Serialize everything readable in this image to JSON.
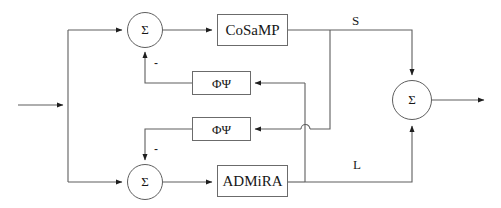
{
  "diagram": {
    "blocks": [
      {
        "id": "cosamp",
        "label": "CoSaMP"
      },
      {
        "id": "admira",
        "label": "ADMiRA"
      },
      {
        "id": "phi_psi_top",
        "label": "ΦΨ"
      },
      {
        "id": "phi_psi_bottom",
        "label": "ΦΨ"
      }
    ],
    "sum_nodes": [
      {
        "id": "sum-top",
        "label": "Σ",
        "sign": "−"
      },
      {
        "id": "sum-bottom",
        "label": "Σ",
        "sign": "−"
      },
      {
        "id": "sum-output",
        "label": "Σ",
        "sign": ""
      }
    ],
    "signal_labels": [
      {
        "id": "signal-s",
        "label": "S"
      },
      {
        "id": "signal-l",
        "label": "L"
      }
    ],
    "sign_marks": [
      {
        "id": "minus-top",
        "label": "-"
      },
      {
        "id": "minus-bottom",
        "label": "-"
      }
    ],
    "colors": {
      "wire": "#5e5e5e",
      "box_border": "#6b6b6b",
      "background": "#ffffff",
      "text": "#161616"
    }
  }
}
